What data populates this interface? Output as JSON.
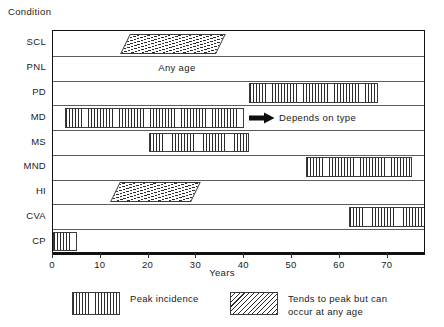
{
  "chart_data": {
    "type": "bar",
    "orientation": "horizontal",
    "title": "",
    "xlabel": "Years",
    "ylabel": "Condition",
    "xlim": [
      0,
      78
    ],
    "ylim": null,
    "grid": true,
    "xticks": [
      0,
      10,
      20,
      30,
      40,
      50,
      60,
      70
    ],
    "xticklabels": [
      "0",
      "10",
      "20",
      "30",
      "40",
      "50",
      "60",
      "70"
    ],
    "categories": [
      "SCL",
      "PNL",
      "PD",
      "MD",
      "MS",
      "MND",
      "HI",
      "CVA",
      "CP"
    ],
    "legend_position": "below-plot",
    "series": [
      {
        "name": "Peak incidence",
        "pattern": "vertical-lines",
        "bars": [
          {
            "category": "PD",
            "start": 41,
            "end": 68
          },
          {
            "category": "MD",
            "start": 2.5,
            "end": 40
          },
          {
            "category": "MS",
            "start": 20,
            "end": 41
          },
          {
            "category": "MND",
            "start": 53,
            "end": 75
          },
          {
            "category": "CVA",
            "start": 62,
            "end": 78
          },
          {
            "category": "CP",
            "start": 0,
            "end": 5
          }
        ]
      },
      {
        "name": "Tends to peak but can occur at any age",
        "pattern": "diagonal-hatch",
        "bars": [
          {
            "category": "SCL",
            "start": 15,
            "end": 35
          },
          {
            "category": "HI",
            "start": 13,
            "end": 30
          }
        ]
      }
    ],
    "annotations": [
      {
        "category": "PNL",
        "text": "Any age",
        "x": 22,
        "arrow": false
      },
      {
        "category": "MD",
        "text": "Depends on type",
        "x": 41,
        "arrow": true
      }
    ]
  },
  "axes": {
    "y_axis_title": "Condition",
    "x_axis_title": "Years",
    "row_labels": [
      "SCL",
      "PNL",
      "PD",
      "MD",
      "MS",
      "MND",
      "HI",
      "CVA",
      "CP"
    ],
    "tick_labels": [
      "0",
      "10",
      "20",
      "30",
      "40",
      "50",
      "60",
      "70"
    ]
  },
  "annotations": {
    "any_age": "Any age",
    "depends_on_type": "Depends on type",
    "arrow_icon": "right-arrow-icon"
  },
  "legend": {
    "items": [
      {
        "label": "Peak incidence",
        "pattern": "vertical-lines"
      },
      {
        "label": "Tends to peak but can\noccur at any age",
        "pattern": "diagonal-hatch"
      }
    ]
  },
  "colors": {
    "ink": "#1a1a1a",
    "frame": "#111111",
    "gridline": "#5d5d5d",
    "hatch": "#2b2b2b",
    "background": "#ffffff"
  }
}
